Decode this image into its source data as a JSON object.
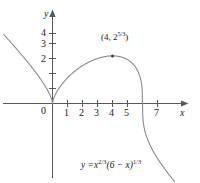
{
  "figure": {
    "background_color": "#ffffff",
    "curve_color": "#8a8a8a",
    "axis_color": "#55585a",
    "text_color": "#1a1a1a"
  },
  "axes": {
    "x_name": "x",
    "y_name": "y",
    "origin_label": "0",
    "x_ticks": [
      "1",
      "2",
      "3",
      "4",
      "5",
      "7"
    ],
    "y_ticks": [
      "2",
      "3",
      "4"
    ],
    "x_range": [
      -3.5,
      9.8
    ],
    "y_range": [
      -5.2,
      5.1
    ],
    "x_tick_values": [
      1,
      2,
      3,
      4,
      5,
      7
    ],
    "y_tick_values": [
      2,
      3,
      4
    ],
    "grid": false
  },
  "annotations": {
    "max_point_label": {
      "text": "(4, 2^{5/3})",
      "base": "(4, 2",
      "exponent": "5/3",
      "close": ")",
      "x": 4,
      "y": 3.1748
    },
    "equation_label": {
      "text": "y = x^{2/3}(6 - x)^{1/3}",
      "lhs": "y =",
      "var1": "x",
      "exp1": "2/3",
      "mid": "(6 − x)",
      "exp2": "1/3"
    }
  },
  "chart_data": {
    "type": "line",
    "xlabel": "x",
    "ylabel": "y",
    "xlim": [
      -3.5,
      9.8
    ],
    "ylim": [
      -5.2,
      5.1
    ],
    "grid": false,
    "legend": "none",
    "function": "y = x^(2/3) * (6 - x)^(1/3)",
    "xticks": [
      1,
      2,
      3,
      4,
      5,
      7
    ],
    "yticks": [
      2,
      3,
      4
    ],
    "annotated_points": [
      {
        "label": "(4, 2^{5/3})",
        "x": 4,
        "y": 3.1748
      }
    ],
    "key_features": {
      "cusp_at_origin": [
        0,
        0
      ],
      "local_maximum": [
        4,
        3.1748
      ],
      "x_intercepts": [
        0,
        6
      ],
      "vertical_tangent": [
        6,
        0
      ]
    },
    "series": [
      {
        "name": "y = x^(2/3)(6 - x)^(1/3)",
        "x": [
          -3.2,
          -3.0,
          -2.6,
          -2.2,
          -1.8,
          -1.4,
          -1.0,
          -0.7,
          -0.45,
          -0.25,
          -0.12,
          -0.05,
          -0.015,
          0,
          0.015,
          0.05,
          0.12,
          0.25,
          0.45,
          0.7,
          1.0,
          1.4,
          1.8,
          2.2,
          2.6,
          3.0,
          3.4,
          3.8,
          4.0,
          4.3,
          4.6,
          4.9,
          5.2,
          5.45,
          5.65,
          5.8,
          5.9,
          5.96,
          5.99,
          6.0,
          6.01,
          6.04,
          6.1,
          6.2,
          6.35,
          6.55,
          6.8,
          7.1,
          7.5,
          7.9,
          8.4,
          8.9,
          9.4,
          9.8
        ],
        "y": [
          4.8,
          4.62,
          4.26,
          3.91,
          3.55,
          3.19,
          2.81,
          2.51,
          2.21,
          1.83,
          1.38,
          0.93,
          0.51,
          0.0,
          0.51,
          0.93,
          1.38,
          1.83,
          2.21,
          2.51,
          2.92,
          3.06,
          3.14,
          3.17,
          3.17,
          3.12,
          3.04,
          2.9,
          3.1748,
          2.74,
          2.51,
          2.2,
          1.8,
          1.42,
          1.08,
          0.76,
          0.52,
          0.34,
          0.19,
          0.0,
          -0.52,
          -0.82,
          -1.1,
          -1.39,
          -1.7,
          -2.05,
          -2.43,
          -2.84,
          -3.33,
          -3.78,
          -4.3,
          -4.78,
          -5.24,
          -5.6
        ]
      }
    ]
  }
}
